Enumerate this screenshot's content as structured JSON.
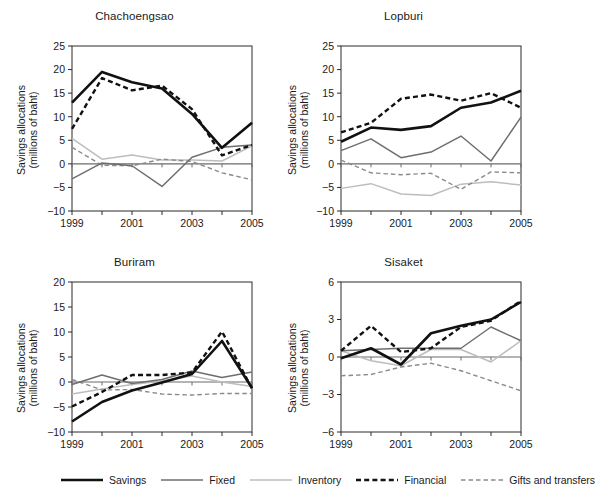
{
  "figure": {
    "series_names": [
      "Savings",
      "Fixed",
      "Inventory",
      "Financial",
      "Gifts and transfers"
    ],
    "axis_title_line1": "Savings allocations",
    "axis_title_line2": "(millions of baht)"
  },
  "legend": {
    "items": [
      {
        "label": "Savings",
        "style": "solid",
        "color": "#111111",
        "width": 2.6
      },
      {
        "label": "Fixed",
        "style": "solid",
        "color": "#6e6e6e",
        "width": 1.5
      },
      {
        "label": "Inventory",
        "style": "solid",
        "color": "#bdbdbd",
        "width": 1.5
      },
      {
        "label": "Financial",
        "style": "dashed",
        "color": "#111111",
        "width": 2.4
      },
      {
        "label": "Gifts and transfers",
        "style": "dashed",
        "color": "#8a8a8a",
        "width": 1.4
      }
    ]
  },
  "chart_data": [
    {
      "type": "line",
      "title": "Chachoengsao",
      "xlabel": "",
      "ylabel": "Savings allocations (millions of baht)",
      "x": [
        1999,
        2000,
        2001,
        2002,
        2003,
        2004,
        2005
      ],
      "xticklabels": [
        "1999",
        "",
        "2001",
        "",
        "2003",
        "",
        "2005"
      ],
      "xlim": [
        1999,
        2005
      ],
      "ylim": [
        -10,
        25
      ],
      "yticks": [
        -10,
        -5,
        0,
        5,
        10,
        15,
        20,
        25
      ],
      "yticklabels": [
        "−10",
        "−5",
        "0",
        "5",
        "10",
        "15",
        "20",
        "25"
      ],
      "grid": false,
      "zero_line": true,
      "series": [
        {
          "name": "Savings",
          "values": [
            13.0,
            19.5,
            17.3,
            16.0,
            10.6,
            3.4,
            8.7
          ]
        },
        {
          "name": "Fixed",
          "values": [
            -3.2,
            0.2,
            -0.4,
            -4.8,
            1.4,
            3.5,
            4.0
          ]
        },
        {
          "name": "Inventory",
          "values": [
            5.4,
            1.0,
            1.9,
            0.8,
            0.8,
            0.6,
            3.8
          ]
        },
        {
          "name": "Financial",
          "values": [
            7.4,
            18.2,
            15.6,
            16.6,
            11.6,
            1.8,
            4.0
          ]
        },
        {
          "name": "Gifts and transfers",
          "values": [
            3.5,
            -0.3,
            -0.4,
            1.0,
            0.5,
            -1.9,
            -3.4
          ]
        }
      ]
    },
    {
      "type": "line",
      "title": "Lopburi",
      "xlabel": "",
      "ylabel": "Savings allocations (millions of baht)",
      "x": [
        1999,
        2000,
        2001,
        2002,
        2003,
        2004,
        2005
      ],
      "xticklabels": [
        "1999",
        "",
        "2001",
        "",
        "2003",
        "",
        "2005"
      ],
      "xlim": [
        1999,
        2005
      ],
      "ylim": [
        -10,
        25
      ],
      "yticks": [
        -10,
        -5,
        0,
        5,
        10,
        15,
        20,
        25
      ],
      "yticklabels": [
        "−10",
        "−5",
        "0",
        "5",
        "10",
        "15",
        "20",
        "25"
      ],
      "grid": false,
      "zero_line": true,
      "series": [
        {
          "name": "Savings",
          "values": [
            4.7,
            7.7,
            7.2,
            8.0,
            11.9,
            13.0,
            15.5
          ]
        },
        {
          "name": "Fixed",
          "values": [
            2.8,
            5.3,
            1.3,
            2.5,
            5.9,
            0.6,
            9.9
          ]
        },
        {
          "name": "Inventory",
          "values": [
            -5.2,
            -4.2,
            -6.4,
            -6.7,
            -4.3,
            -3.8,
            -4.5
          ]
        },
        {
          "name": "Financial",
          "values": [
            6.7,
            8.7,
            13.8,
            14.7,
            13.4,
            15.0,
            11.9
          ]
        },
        {
          "name": "Gifts and transfers",
          "values": [
            0.8,
            -1.9,
            -2.3,
            -2.0,
            -5.4,
            -1.7,
            -1.9
          ]
        }
      ]
    },
    {
      "type": "line",
      "title": "Buriram",
      "xlabel": "",
      "ylabel": "Savings allocations (millions of baht)",
      "x": [
        1999,
        2000,
        2001,
        2002,
        2003,
        2004,
        2005
      ],
      "xticklabels": [
        "1999",
        "",
        "2001",
        "",
        "2003",
        "",
        "2005"
      ],
      "xlim": [
        1999,
        2005
      ],
      "ylim": [
        -10,
        20
      ],
      "yticks": [
        -10,
        -5,
        0,
        5,
        10,
        15,
        20
      ],
      "yticklabels": [
        "−10",
        "−5",
        "0",
        "5",
        "10",
        "15",
        "20"
      ],
      "grid": false,
      "zero_line": true,
      "series": [
        {
          "name": "Savings",
          "values": [
            -7.9,
            -4.0,
            -1.7,
            -0.1,
            1.6,
            8.2,
            -1.2
          ]
        },
        {
          "name": "Fixed",
          "values": [
            -0.5,
            1.4,
            -0.3,
            0.5,
            2.2,
            0.9,
            2.0
          ]
        },
        {
          "name": "Inventory",
          "values": [
            -2.4,
            -1.4,
            -0.5,
            0.2,
            1.2,
            0.0,
            -0.9
          ]
        },
        {
          "name": "Financial",
          "values": [
            -4.9,
            -2.0,
            1.4,
            1.4,
            1.9,
            10.1,
            -1.3
          ]
        },
        {
          "name": "Gifts and transfers",
          "values": [
            0.5,
            -1.6,
            -1.5,
            -2.4,
            -2.6,
            -2.3,
            -2.3
          ]
        }
      ]
    },
    {
      "type": "line",
      "title": "Sisaket",
      "xlabel": "",
      "ylabel": "Savings allocations (millions of baht)",
      "x": [
        1999,
        2000,
        2001,
        2002,
        2003,
        2004,
        2005
      ],
      "xticklabels": [
        "1999",
        "",
        "2001",
        "",
        "2003",
        "",
        "2005"
      ],
      "xlim": [
        1999,
        2005
      ],
      "ylim": [
        -6,
        6
      ],
      "yticks": [
        -6,
        -3,
        0,
        3,
        6
      ],
      "yticklabels": [
        "−6",
        "−3",
        "0",
        "3",
        "6"
      ],
      "grid": false,
      "zero_line": true,
      "series": [
        {
          "name": "Savings",
          "values": [
            -0.1,
            0.7,
            -0.6,
            1.9,
            2.5,
            3.0,
            4.4
          ]
        },
        {
          "name": "Fixed",
          "values": [
            0.5,
            0.6,
            0.7,
            0.7,
            0.7,
            2.4,
            1.3
          ]
        },
        {
          "name": "Inventory",
          "values": [
            0.5,
            -0.3,
            -0.7,
            0.6,
            0.6,
            -0.4,
            1.3
          ]
        },
        {
          "name": "Financial",
          "values": [
            0.5,
            2.5,
            0.4,
            0.7,
            2.4,
            2.9,
            4.5
          ]
        },
        {
          "name": "Gifts and transfers",
          "values": [
            -1.5,
            -1.4,
            -0.8,
            -0.5,
            -1.1,
            -1.9,
            -2.7
          ]
        }
      ]
    }
  ]
}
